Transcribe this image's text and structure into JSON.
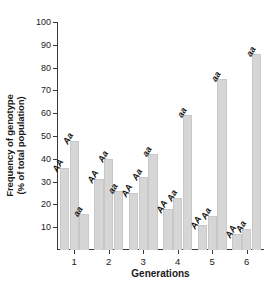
{
  "chart_data": {
    "type": "bar",
    "title": "",
    "xlabel": "Generations",
    "ylabel": "Frequency of genotype\n(% of total population)",
    "ylabel_line1": "Frequency of genotype",
    "ylabel_line2": "(% of total population)",
    "categories": [
      "1",
      "2",
      "3",
      "4",
      "5",
      "6"
    ],
    "ylim": [
      0,
      100
    ],
    "yticks": [
      10,
      20,
      30,
      40,
      50,
      60,
      70,
      80,
      90,
      100
    ],
    "ytick_labels": [
      "10",
      "20",
      "30",
      "40",
      "50",
      "60",
      "70",
      "80",
      "90",
      "100"
    ],
    "grid": false,
    "legend": "none",
    "bar_color": "#d6d6d6",
    "axis_color": "#3a3a3a",
    "series": [
      {
        "name": "AA",
        "label": "AA",
        "values": [
          36,
          31,
          25,
          18,
          11,
          7
        ]
      },
      {
        "name": "Aa",
        "label": "Aa",
        "values": [
          48,
          40,
          32,
          23,
          15,
          9
        ]
      },
      {
        "name": "aa",
        "label": "aa",
        "values": [
          16,
          26,
          42,
          59,
          75,
          86
        ]
      }
    ],
    "bar_annotations": [
      [
        "AA",
        "Aa",
        "aa"
      ],
      [
        "AA",
        "Aa",
        "aa"
      ],
      [
        "AA",
        "Aa",
        "aa"
      ],
      [
        "AA",
        "Aa",
        "aa"
      ],
      [
        "AA",
        "Aa",
        "aa"
      ],
      [
        "AA",
        "Aa",
        "aa"
      ]
    ]
  }
}
